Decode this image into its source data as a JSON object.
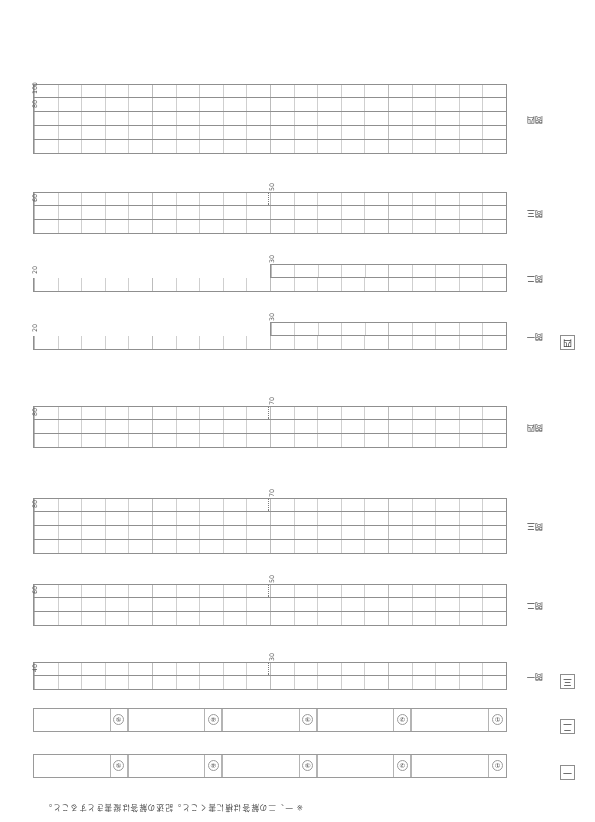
{
  "page": {
    "width": 595,
    "height": 822,
    "rotation_deg": 180,
    "background": "#ffffff",
    "ink_color": "#3a3a3a",
    "rule_color": "#8f8f8f",
    "light_rule_color": "#cfcfcf"
  },
  "note": "※ 一、二の解答は横に書くこと。記述の解答は縦書きとすること。",
  "sections": [
    {
      "id": "section-1",
      "marker": "一",
      "type": "strip",
      "items": [
        "①",
        "②",
        "③",
        "④",
        "⑤"
      ]
    },
    {
      "id": "section-2",
      "marker": "二",
      "type": "strip",
      "items": [
        "①",
        "②",
        "③",
        "④",
        "⑤"
      ]
    },
    {
      "id": "section-3",
      "marker": "三",
      "type": "grids",
      "questions": [
        {
          "label": "問一",
          "rows": 2,
          "cols": 20,
          "half_marker": true,
          "counts": [
            {
              "value": "30",
              "position": "row1-middle"
            },
            {
              "value": "40",
              "position": "row1-end"
            }
          ]
        },
        {
          "label": "問二",
          "rows": 3,
          "cols": 20,
          "half_marker": true,
          "counts": [
            {
              "value": "50",
              "position": "row-middle"
            },
            {
              "value": "60",
              "position": "row-end"
            }
          ]
        },
        {
          "label": "問三",
          "rows": 4,
          "cols": 20,
          "half_marker": true,
          "counts": [
            {
              "value": "70",
              "position": "row-middle"
            },
            {
              "value": "80",
              "position": "row-end"
            }
          ]
        },
        {
          "label": "問四",
          "rows": 3,
          "cols": 20,
          "half_marker": true,
          "counts": [
            {
              "value": "70",
              "position": "row-middle"
            },
            {
              "value": "80",
              "position": "row-end"
            }
          ]
        }
      ]
    },
    {
      "id": "section-4",
      "marker": "四",
      "type": "grids",
      "questions": [
        {
          "label": "問一",
          "rows": 2,
          "cols": 20,
          "partial_second_row": true,
          "half_marker": false,
          "counts": [
            {
              "value": "30",
              "position": "row2-end"
            },
            {
              "value": "20",
              "position": "row1-end"
            }
          ]
        },
        {
          "label": "問二",
          "rows": 2,
          "cols": 20,
          "partial_second_row": true,
          "half_marker": false,
          "counts": [
            {
              "value": "30",
              "position": "row2-end"
            },
            {
              "value": "20",
              "position": "row1-end"
            }
          ]
        },
        {
          "label": "問三",
          "rows": 3,
          "cols": 20,
          "half_marker": true,
          "counts": [
            {
              "value": "50",
              "position": "row-middle"
            },
            {
              "value": "60",
              "position": "row-end"
            }
          ]
        },
        {
          "label": "問四",
          "rows": 5,
          "cols": 20,
          "half_marker": false,
          "counts": [
            {
              "value": "80",
              "position": "row4-end"
            },
            {
              "value": "100",
              "position": "row5-end"
            }
          ]
        }
      ]
    }
  ]
}
